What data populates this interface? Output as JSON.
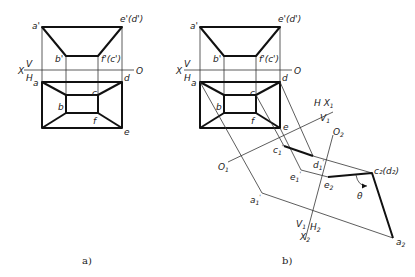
{
  "figure_a": {
    "caption": "a)",
    "front_labels": {
      "a_p": "a'",
      "e_p": "e'(d')",
      "b_p": "b'",
      "f_p": "f'(c')"
    },
    "axis_labels": {
      "x": "X",
      "v": "V",
      "h": "H",
      "o": "O"
    },
    "top_labels": {
      "a": "a",
      "b": "b",
      "c": "c",
      "d": "d",
      "e": "e",
      "f": "f"
    }
  },
  "figure_b": {
    "caption": "b)",
    "front_labels": {
      "a_p": "a'",
      "e_p": "e'(d')",
      "b_p": "b'",
      "f_p": "f'(c')"
    },
    "axis_labels": {
      "x": "X",
      "v": "V",
      "h": "H",
      "o": "O"
    },
    "top_labels": {
      "a": "a",
      "b": "b",
      "c": "c",
      "d": "d",
      "e": "e",
      "f": "f"
    },
    "axis1_labels": {
      "h": "H",
      "x1": "X",
      "x1_sub": "1",
      "v1": "V",
      "v1_sub": "1",
      "o1": "O",
      "o1_sub": "1"
    },
    "axis2_labels": {
      "o2": "O",
      "o2_sub": "2",
      "v1": "V",
      "v1_sub": "1",
      "h2": "H",
      "h2_sub": "2",
      "x2": "X",
      "x2_sub": "2"
    },
    "aux1_labels": {
      "c1": "c",
      "d1": "d",
      "e1": "e",
      "a1": "a",
      "sub": "1",
      "prime": "'"
    },
    "aux2_labels": {
      "c2d2": "c₂(d₂)",
      "e2": "e",
      "a2": "a",
      "sub": "2"
    },
    "angle_label": "θ"
  }
}
